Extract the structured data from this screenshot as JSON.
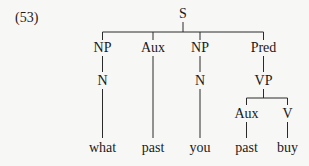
{
  "example_number": "(53)",
  "tree": {
    "root": "S",
    "level1": [
      "NP",
      "Aux",
      "NP",
      "Pred"
    ],
    "level2": [
      "N",
      "N",
      "VP"
    ],
    "vp_children": [
      "Aux",
      "V"
    ],
    "leaves": [
      "what",
      "past",
      "you",
      "past",
      "buy"
    ]
  },
  "colors": {
    "background": "#f7f7f5",
    "text": "#1a1a1a",
    "lines": "#2a2a2a"
  }
}
